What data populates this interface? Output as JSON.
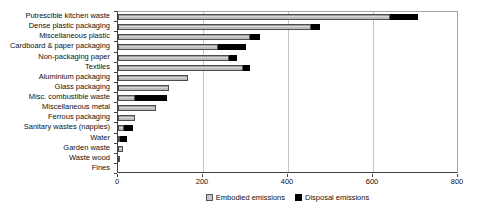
{
  "chart_data": {
    "type": "bar",
    "orientation": "horizontal",
    "stacked": true,
    "title": "",
    "xlabel": "",
    "ylabel": "",
    "xlim": [
      0,
      800
    ],
    "xticks": [
      0,
      200,
      400,
      600,
      800
    ],
    "grid": true,
    "legend_position": "bottom",
    "categories": [
      "Putrescible kitchen waste",
      "Dense plastic packaging",
      "Miscellaneous plastic",
      "Cardboard & paper packaging",
      "Non-packaging paper",
      "Textiles",
      "Aluminium packaging",
      "Glass packaging",
      "Misc. combustible waste",
      "Miscellaneous metal",
      "Ferrous packaging",
      "Sanitary wastes (nappies)",
      "Water",
      "Garden waste",
      "Waste wood",
      "Fines"
    ],
    "series": [
      {
        "name": "Embodied emissions",
        "color": "#c6c6c6",
        "values": [
          640,
          455,
          310,
          235,
          260,
          295,
          165,
          120,
          40,
          90,
          40,
          15,
          5,
          12,
          3,
          0
        ]
      },
      {
        "name": "Disposal emissions",
        "color": "#000000",
        "values": [
          65,
          20,
          25,
          65,
          20,
          15,
          0,
          0,
          75,
          0,
          0,
          20,
          15,
          0,
          0,
          0
        ]
      }
    ]
  },
  "colors": {
    "embodied": "#c6c6c6",
    "disposal": "#000000",
    "gridline": "#c6c6c6",
    "background": "#ffffff"
  }
}
